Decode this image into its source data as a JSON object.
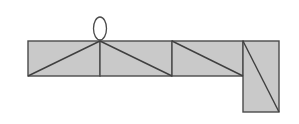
{
  "diagram": {
    "colors": {
      "fill": "#c9c9c9",
      "stroke": "#3f3f3f",
      "background": "#ffffff"
    },
    "panels": [
      {
        "id": "panel-1",
        "x": 28,
        "y": 41,
        "w": 72,
        "h": 35,
        "diagonal": [
          28,
          76,
          100,
          41
        ]
      },
      {
        "id": "panel-2",
        "x": 100,
        "y": 41,
        "w": 72,
        "h": 35,
        "diagonal": [
          100,
          41,
          172,
          76
        ]
      },
      {
        "id": "panel-3",
        "x": 172,
        "y": 41,
        "w": 71,
        "h": 35,
        "diagonal": [
          172,
          41,
          243,
          76
        ]
      },
      {
        "id": "panel-4",
        "x": 243,
        "y": 41,
        "w": 36,
        "h": 71,
        "diagonal": [
          243,
          41,
          279,
          112
        ]
      }
    ],
    "loop": {
      "cx": 100,
      "cy": 28.5,
      "rx": 6.5,
      "ry": 11.5
    }
  }
}
